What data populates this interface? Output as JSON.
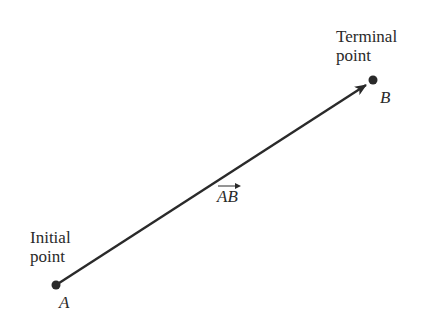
{
  "diagram": {
    "initial": {
      "label_line1": "Initial",
      "label_line2": "point",
      "point_name": "A",
      "x": 56,
      "y": 285
    },
    "terminal": {
      "label_line1": "Terminal",
      "label_line2": "point",
      "point_name": "B",
      "x": 373,
      "y": 80
    },
    "vector_label": "AB",
    "colors": {
      "stroke": "#2a2a2a",
      "text": "#2a2a2a",
      "background": "#ffffff"
    }
  }
}
